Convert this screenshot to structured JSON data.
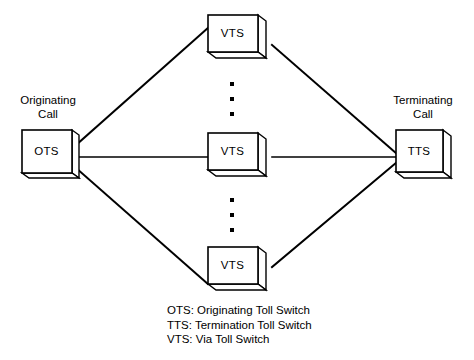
{
  "diagram": {
    "background_color": "#ffffff",
    "line_color": "#000000",
    "box_fill": "#ffffff"
  },
  "nodes": {
    "originating": {
      "label": "OTS",
      "caption_line1": "Originating",
      "caption_line2": "Call"
    },
    "terminating": {
      "label": "TTS",
      "caption_line1": "Terminating",
      "caption_line2": "Call"
    },
    "via_top": {
      "label": "VTS"
    },
    "via_middle": {
      "label": "VTS"
    },
    "via_bottom": {
      "label": "VTS"
    }
  },
  "ellipsis": {
    "upper_dots": 3,
    "lower_dots": 3
  },
  "legend": {
    "rows": [
      "OTS: Originating Toll Switch",
      "TTS: Termination Toll Switch",
      "VTS: Via Toll Switch"
    ]
  }
}
